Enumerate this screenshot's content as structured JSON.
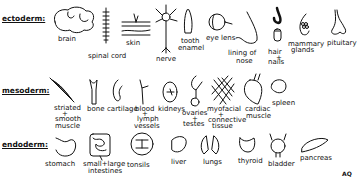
{
  "diagram": {
    "type": "germ-layer-derivatives",
    "layers": [
      {
        "name": "ectoderm:",
        "items": [
          {
            "label": "brain"
          },
          {
            "label": "spinal cord"
          },
          {
            "label": "skin"
          },
          {
            "label": "nerve"
          },
          {
            "label": "tooth enamel",
            "lines": [
              "tooth",
              "enamel"
            ]
          },
          {
            "label": "eye lens"
          },
          {
            "label": "lining of nose",
            "lines": [
              "lining of",
              "nose"
            ]
          },
          {
            "label": "hair + nails",
            "lines": [
              "hair",
              "+",
              "nails"
            ]
          },
          {
            "label": "mammary glands",
            "lines": [
              "mammary",
              "glands"
            ]
          },
          {
            "label": "pituitary"
          }
        ]
      },
      {
        "name": "mesoderm:",
        "items": [
          {
            "label": "striated + smooth muscle",
            "lines": [
              "striated",
              "+",
              "smooth",
              "muscle"
            ]
          },
          {
            "label": "bone"
          },
          {
            "label": "cartilage"
          },
          {
            "label": "blood + lymph vessels",
            "lines": [
              "blood",
              "+",
              "lymph",
              "vessels"
            ]
          },
          {
            "label": "kidneys"
          },
          {
            "label": "ovaries + testes",
            "lines": [
              "ovaries",
              "+",
              "testes"
            ]
          },
          {
            "label": "myofascial + connective tissue",
            "lines": [
              "myofacial",
              "+",
              "connective",
              "tissue"
            ]
          },
          {
            "label": "cardiac muscle",
            "lines": [
              "cardiac",
              "muscle"
            ]
          },
          {
            "label": "spleen"
          }
        ]
      },
      {
        "name": "endoderm:",
        "items": [
          {
            "label": "stomach"
          },
          {
            "label": "small + large intestines",
            "lines": [
              "small+large",
              "intestines"
            ]
          },
          {
            "label": "tonsils"
          },
          {
            "label": "liver"
          },
          {
            "label": "lungs"
          },
          {
            "label": "thyroid"
          },
          {
            "label": "bladder"
          },
          {
            "label": "pancreas"
          }
        ]
      }
    ],
    "signature": "AQ"
  }
}
